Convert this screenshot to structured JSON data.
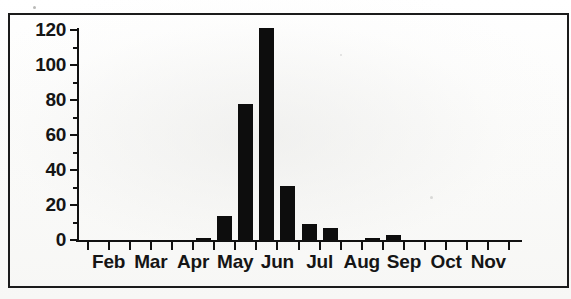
{
  "figure": {
    "border_color": "#1b1b1b",
    "bar_color": "#0d0d0d",
    "background": "#fdfdfc"
  },
  "chart_data": {
    "type": "bar",
    "title": "",
    "subtitle": "",
    "xlabel": "",
    "ylabel": "",
    "ylim": [
      0,
      120
    ],
    "yticks": [
      0,
      20,
      40,
      60,
      80,
      100,
      120
    ],
    "ytick_labels": [
      "0",
      "20",
      "40",
      "60",
      "80",
      "100",
      "120"
    ],
    "grid": false,
    "legend": null,
    "xtick_labels": [
      "Feb",
      "Mar",
      "Apr",
      "May",
      "Jun",
      "Jul",
      "Aug",
      "Sep",
      "Oct",
      "Nov"
    ],
    "x_positions_halfmonth": [
      "Feb-early",
      "Feb-mid",
      "Mar-early",
      "Mar-mid",
      "Apr-early",
      "Apr-mid",
      "May-early",
      "May-mid",
      "Jun-early",
      "Jun-mid",
      "Jul-early",
      "Jul-mid",
      "Aug-early",
      "Aug-mid",
      "Sep-early",
      "Sep-mid",
      "Oct-early",
      "Oct-mid",
      "Nov-early",
      "Nov-mid"
    ],
    "categories": [
      "Feb-early",
      "Feb-mid",
      "Mar-early",
      "Mar-mid",
      "Apr-early",
      "Apr-mid",
      "May-early",
      "May-mid",
      "Jun-early",
      "Jun-mid",
      "Jul-early",
      "Jul-mid",
      "Aug-early",
      "Aug-mid",
      "Sep-early",
      "Sep-mid",
      "Oct-early",
      "Oct-mid",
      "Nov-early",
      "Nov-mid"
    ],
    "values": [
      0,
      0,
      0,
      0,
      0,
      1,
      14,
      78,
      121,
      31,
      9,
      7,
      0,
      1,
      3,
      0,
      0,
      0,
      0,
      0
    ],
    "bars": [
      {
        "label": "Apr-mid",
        "value": 1,
        "x_frac": 0.263
      },
      {
        "label": "May-early",
        "value": 14,
        "x_frac": 0.318
      },
      {
        "label": "May-mid",
        "value": 78,
        "x_frac": 0.372
      },
      {
        "label": "Jun-early",
        "value": 121,
        "x_frac": 0.427
      },
      {
        "label": "Jun-mid",
        "value": 31,
        "x_frac": 0.481
      },
      {
        "label": "Jul-early",
        "value": 9,
        "x_frac": 0.536
      },
      {
        "label": "Jul-mid",
        "value": 7,
        "x_frac": 0.59
      },
      {
        "label": "Aug-mid",
        "value": 1,
        "x_frac": 0.7
      },
      {
        "label": "Sep-early",
        "value": 3,
        "x_frac": 0.754
      }
    ]
  }
}
